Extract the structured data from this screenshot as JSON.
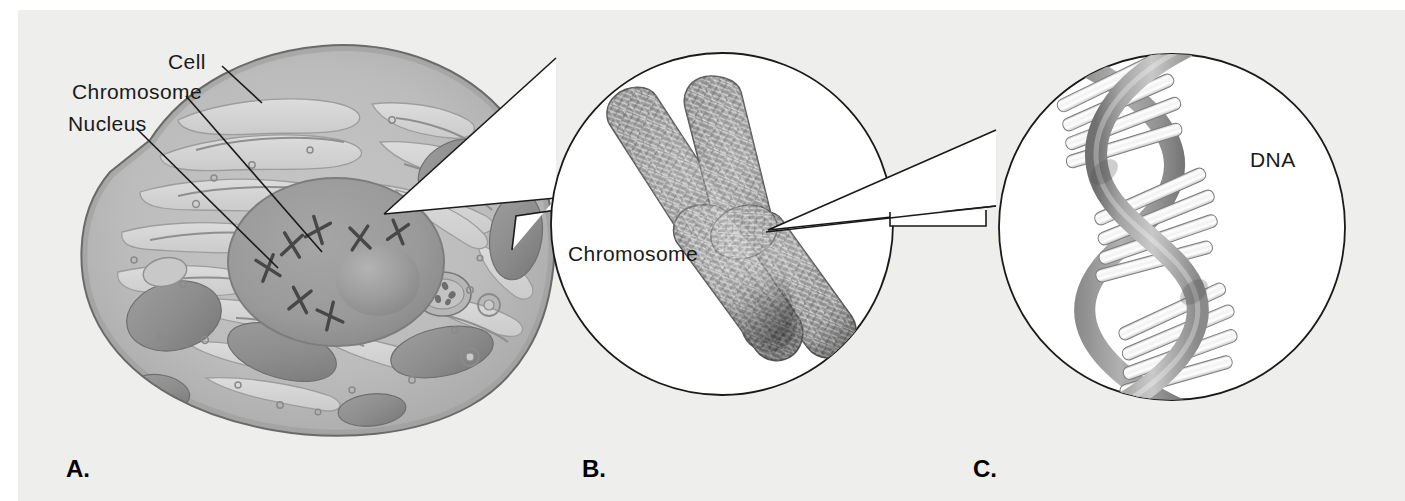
{
  "figure": {
    "background_color": "#eeeeec",
    "line_color": "#1a1a1a"
  },
  "panels": [
    {
      "letter": "A.",
      "subject": "cell",
      "labels": [
        {
          "name": "cell",
          "text": "Cell"
        },
        {
          "name": "chromosome",
          "text": "Chromosome"
        },
        {
          "name": "nucleus",
          "text": "Nucleus"
        }
      ]
    },
    {
      "letter": "B.",
      "subject": "chromosome",
      "labels": [
        {
          "name": "chromosome",
          "text": "Chromosome"
        }
      ]
    },
    {
      "letter": "C.",
      "subject": "dna",
      "labels": [
        {
          "name": "dna",
          "text": "DNA"
        }
      ]
    }
  ],
  "colors": {
    "cytoplasm": "#b8b8b8",
    "cytoplasm_light": "#cfcfcf",
    "er_channel": "#dedede",
    "nucleus": "#9a9a9a",
    "nucleolus": "#8d8d8d",
    "mitochondria": "#8f8f8f",
    "chromosome_fill": "#8a8a8a",
    "dna_backbone": "#9e9e9e",
    "dna_rung": "#f4f4f4",
    "outline": "#555555",
    "stroke": "#1a1a1a"
  }
}
